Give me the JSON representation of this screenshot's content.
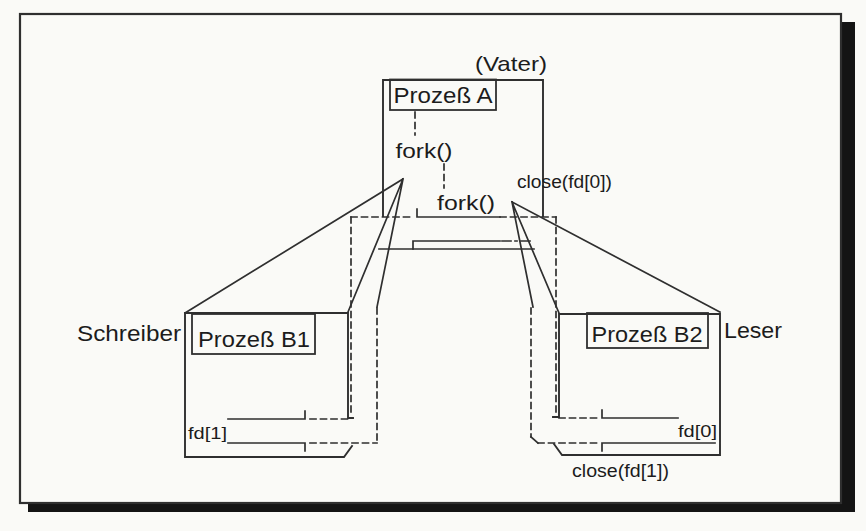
{
  "figure": {
    "parent_process": {
      "role_note": "(Vater)",
      "title": "Prozeß A",
      "fork_call_1": "fork()",
      "fork_call_2": "fork()",
      "close_note": "close(fd[0])"
    },
    "writer_process": {
      "role": "Schreiber",
      "title": "Prozeß B1",
      "fd_label": "fd[1]"
    },
    "reader_process": {
      "role": "Leser",
      "title": "Prozeß B2",
      "fd_label": "fd[0]",
      "close_note": "close(fd[1])"
    },
    "colors": {
      "ink": "#2f2f2f",
      "text": "#1c1c1c",
      "paper": "#fafaf7",
      "shadow": "#141414"
    }
  }
}
